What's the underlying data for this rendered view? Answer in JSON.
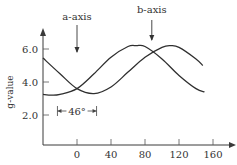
{
  "chart_data": {
    "type": "line",
    "title": "",
    "xlabel": "",
    "ylabel": "g-value",
    "xlim": [
      -40,
      180
    ],
    "ylim": [
      0,
      7
    ],
    "x_ticks": [
      0,
      40,
      80,
      120,
      160
    ],
    "x_tick_labels": [
      "0",
      "40",
      "80",
      "120",
      "160"
    ],
    "y_ticks": [
      2.0,
      4.0,
      6.0
    ],
    "y_tick_labels": [
      "2.0",
      "4.0",
      "6.0"
    ],
    "grid": false,
    "legend": "none",
    "series": [
      {
        "name": "curve-1",
        "x": [
          -40,
          -20,
          0,
          20,
          40,
          60,
          80,
          100,
          110,
          120,
          140,
          148
        ],
        "y": [
          5.45,
          4.5,
          3.6,
          3.3,
          3.7,
          4.6,
          5.5,
          6.1,
          6.2,
          6.1,
          5.4,
          5.0
        ]
      },
      {
        "name": "curve-2",
        "x": [
          -40,
          -30,
          -20,
          0,
          20,
          40,
          60,
          70,
          80,
          100,
          120,
          140,
          150
        ],
        "y": [
          3.25,
          3.2,
          3.25,
          3.6,
          4.5,
          5.5,
          6.15,
          6.2,
          6.15,
          5.4,
          4.4,
          3.6,
          3.4
        ]
      }
    ],
    "annotations": [
      {
        "text": "a-axis",
        "x": 0,
        "type": "arrow-down"
      },
      {
        "text": "b-axis",
        "x": 88,
        "type": "arrow-down"
      },
      {
        "text": "46°",
        "x_from": -23,
        "x_to": 23,
        "type": "span"
      }
    ]
  }
}
